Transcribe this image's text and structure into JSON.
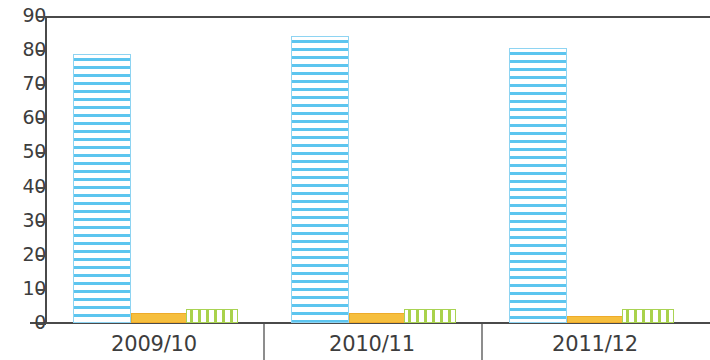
{
  "chart_data": {
    "type": "bar",
    "title": "",
    "subtitle": "",
    "xlabel": "",
    "ylabel": "",
    "grid": false,
    "legend_position": "none",
    "ylim": [
      0,
      90
    ],
    "ytick_labels": [
      "90",
      "80",
      "70",
      "60",
      "50",
      "40",
      "30",
      "20",
      "10",
      "0"
    ],
    "ytick_values": [
      90,
      80,
      70,
      60,
      50,
      40,
      30,
      20,
      10,
      0
    ],
    "categories": [
      "2009/10",
      "2010/11",
      "2011/12"
    ],
    "series": [
      {
        "name": "series-blue",
        "color": "#5cc5ef",
        "pattern": "horizontal-hatch",
        "values": [
          79,
          84,
          80.5
        ]
      },
      {
        "name": "series-orange",
        "color": "#f6bf3e",
        "pattern": "solid",
        "values": [
          3,
          2.8,
          2
        ]
      },
      {
        "name": "series-green",
        "color": "#a9d24b",
        "pattern": "vertical-hatch",
        "values": [
          4,
          4,
          4
        ]
      }
    ]
  },
  "axis": {
    "line_color": "#4a4a4a",
    "separator_color": "#8d8d8d"
  }
}
